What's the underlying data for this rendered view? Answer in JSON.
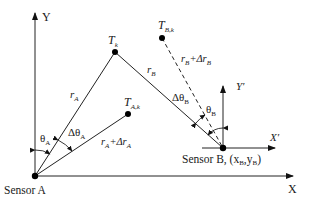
{
  "diagram": {
    "axes": {
      "global_x_label": "X",
      "global_y_label": "Y",
      "local_x_label": "X′",
      "local_y_label": "Y′"
    },
    "sensors": {
      "a_label": "Sensor A",
      "b_label_main": "Sensor B, (x",
      "b_sub_x": "B",
      "b_comma": ",y",
      "b_sub_y": "B",
      "b_close": ")"
    },
    "targets": {
      "tk_main": "T",
      "tk_sub": "k",
      "tak_main": "T",
      "tak_sub": "A,k",
      "tbk_main": "T",
      "tbk_sub": "B,k"
    },
    "ranges": {
      "ra_main": "r",
      "ra_sub": "A",
      "rb_main": "r",
      "rb_sub": "B",
      "ra_delta_main": "r",
      "ra_delta_sub1": "A",
      "ra_delta_plus": "+Δr",
      "ra_delta_sub2": "A",
      "rb_delta_main": "r",
      "rb_delta_sub1": "B",
      "rb_delta_plus": "+Δr",
      "rb_delta_sub2": "B"
    },
    "angles": {
      "theta_a_main": "θ",
      "theta_a_sub": "A",
      "dtheta_a_main": "Δθ",
      "dtheta_a_sub": "A",
      "theta_b_main": "θ",
      "theta_b_sub": "B",
      "dtheta_b_main": "Δθ",
      "dtheta_b_sub": "B"
    }
  }
}
